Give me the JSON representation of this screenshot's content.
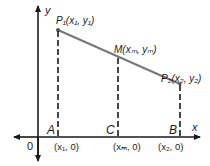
{
  "diagram": {
    "axes": {
      "x_label": "x",
      "y_label": "y",
      "origin_label": "0"
    },
    "points": [
      {
        "id": "P1",
        "label": "P₁(x₁, y₁)"
      },
      {
        "id": "M",
        "label": "M(xₘ, yₘ)"
      },
      {
        "id": "P2",
        "label": "P₂(x₂, y₂)"
      }
    ],
    "feet": [
      {
        "id": "A",
        "label": "A",
        "coord": "(x₁, 0)"
      },
      {
        "id": "C",
        "label": "C",
        "coord": "(xₘ, 0)"
      },
      {
        "id": "B",
        "label": "B",
        "coord": "(x₂, 0)"
      }
    ],
    "colors": {
      "segment": "#777777",
      "axis": "#1a1a1a",
      "dashed": "#1a1a1a"
    }
  }
}
